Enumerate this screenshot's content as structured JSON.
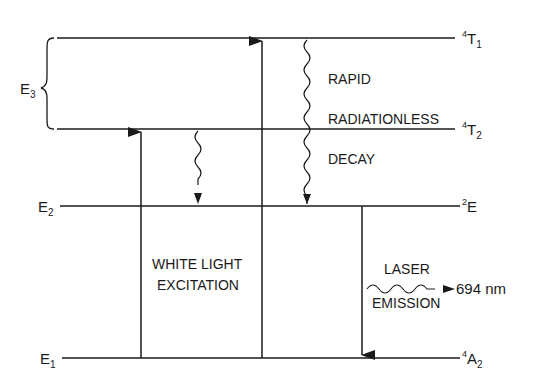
{
  "diagram": {
    "levels": [
      {
        "id": "T1",
        "left_label": "",
        "right_label_sup": "4",
        "right_label_main": "T",
        "right_label_sub": "1"
      },
      {
        "id": "T2",
        "left_label": "",
        "right_label_sup": "4",
        "right_label_main": "T",
        "right_label_sub": "2"
      },
      {
        "id": "E",
        "left_label_main": "E",
        "left_label_sub": "2",
        "right_label_sup": "2",
        "right_label_main": "E",
        "right_label_sub": ""
      },
      {
        "id": "A2",
        "left_label_main": "E",
        "left_label_sub": "1",
        "right_label_sup": "4",
        "right_label_main": "A",
        "right_label_sub": "2"
      }
    ],
    "brace_label": {
      "main": "E",
      "sub": "3"
    },
    "decay_text": [
      "RAPID",
      "RADIATIONLESS",
      "DECAY"
    ],
    "excitation_text": [
      "WHITE LIGHT",
      "EXCITATION"
    ],
    "emission_text": [
      "LASER",
      "EMISSION"
    ],
    "wavelength": "694 nm",
    "line_color": "#1a1a1a"
  }
}
